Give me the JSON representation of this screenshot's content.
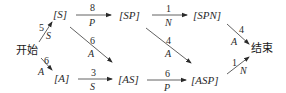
{
  "diagram": {
    "type": "state-transition",
    "nodes": {
      "start": "开始",
      "end": "结束",
      "S": "[S]",
      "A": "[A]",
      "SP": "[SP]",
      "AS": "[AS]",
      "SPN": "[SPN]",
      "ASP": "[ASP]"
    },
    "edges": [
      {
        "from": "start",
        "to": "S",
        "weight": "5",
        "symbol": "S"
      },
      {
        "from": "start",
        "to": "A",
        "weight": "6",
        "symbol": "A"
      },
      {
        "from": "S",
        "to": "SP",
        "weight": "8",
        "symbol": "P"
      },
      {
        "from": "S",
        "to": "AS",
        "weight": "6",
        "symbol": "A"
      },
      {
        "from": "A",
        "to": "AS",
        "weight": "3",
        "symbol": "S"
      },
      {
        "from": "SP",
        "to": "SPN",
        "weight": "1",
        "symbol": "N"
      },
      {
        "from": "SP",
        "to": "ASP",
        "weight": "4",
        "symbol": "A"
      },
      {
        "from": "AS",
        "to": "ASP",
        "weight": "6",
        "symbol": "P"
      },
      {
        "from": "SPN",
        "to": "end",
        "weight": "4",
        "symbol": "A"
      },
      {
        "from": "ASP",
        "to": "end",
        "weight": "1",
        "symbol": "N"
      }
    ]
  }
}
